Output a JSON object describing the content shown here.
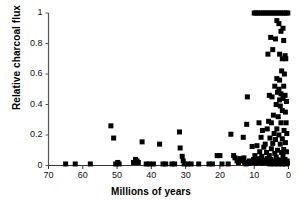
{
  "chart_data": {
    "type": "scatter",
    "title": "",
    "xlabel": "Millions of years",
    "ylabel": "Relative charcoal flux",
    "xlim": [
      70,
      0
    ],
    "ylim": [
      0,
      1
    ],
    "x_reversed": true,
    "grid": false,
    "legend": null,
    "marker": "filled-square",
    "marker_color": "#000000",
    "marker_size_px": 5,
    "xticks": [
      70,
      60,
      50,
      40,
      30,
      20,
      10,
      0
    ],
    "xtick_labels": [
      "70",
      "60",
      "50",
      "40",
      "30",
      "20",
      "10",
      "0"
    ],
    "yticks": [
      0,
      0.2,
      0.4,
      0.6,
      0.8,
      1
    ],
    "ytick_labels": [
      "0",
      "0.2",
      "0.4",
      "0.6",
      "0.8",
      "1"
    ],
    "series": [
      {
        "name": "Charcoal flux record",
        "points": [
          [
            65.0,
            0.01
          ],
          [
            62.2,
            0.01
          ],
          [
            57.8,
            0.01
          ],
          [
            51.8,
            0.26
          ],
          [
            51.0,
            0.18
          ],
          [
            50.4,
            0.01
          ],
          [
            49.8,
            0.02
          ],
          [
            49.4,
            0.01
          ],
          [
            45.2,
            0.02
          ],
          [
            44.6,
            0.04
          ],
          [
            44.2,
            0.03
          ],
          [
            43.8,
            0.02
          ],
          [
            42.7,
            0.155
          ],
          [
            41.5,
            0.01
          ],
          [
            40.6,
            0.01
          ],
          [
            39.4,
            0.01
          ],
          [
            37.6,
            0.14
          ],
          [
            36.6,
            0.01
          ],
          [
            35.8,
            0.01
          ],
          [
            34.0,
            0.01
          ],
          [
            33.2,
            0.01
          ],
          [
            31.8,
            0.22
          ],
          [
            31.6,
            0.115
          ],
          [
            31.0,
            0.06
          ],
          [
            30.7,
            0.03
          ],
          [
            30.4,
            0.01
          ],
          [
            29.4,
            0.01
          ],
          [
            28.4,
            0.01
          ],
          [
            26.2,
            0.01
          ],
          [
            23.2,
            0.01
          ],
          [
            22.2,
            0.01
          ],
          [
            20.8,
            0.065
          ],
          [
            20.0,
            0.065
          ],
          [
            19.4,
            0.01
          ],
          [
            17.6,
            0.01
          ],
          [
            16.8,
            0.205
          ],
          [
            16.0,
            0.065
          ],
          [
            15.6,
            0.05
          ],
          [
            15.0,
            0.03
          ],
          [
            14.6,
            0.02
          ],
          [
            14.2,
            0.045
          ],
          [
            13.4,
            0.03
          ],
          [
            13.0,
            0.05
          ],
          [
            12.8,
            0.02
          ],
          [
            13.2,
            0.185
          ],
          [
            12.0,
            0.45
          ],
          [
            12.2,
            0.27
          ],
          [
            11.4,
            0.03
          ],
          [
            11.0,
            0.02
          ],
          [
            10.6,
            0.125
          ],
          [
            10.4,
            0.02
          ],
          [
            10.0,
            1.0
          ],
          [
            9.6,
            1.0
          ],
          [
            9.0,
            1.0
          ],
          [
            8.4,
            1.0
          ],
          [
            7.8,
            1.0
          ],
          [
            7.2,
            1.0
          ],
          [
            6.6,
            1.0
          ],
          [
            6.0,
            1.0
          ],
          [
            5.4,
            1.0
          ],
          [
            4.8,
            1.0
          ],
          [
            4.2,
            1.0
          ],
          [
            3.6,
            1.0
          ],
          [
            3.0,
            1.0
          ],
          [
            2.4,
            1.0
          ],
          [
            1.8,
            1.0
          ],
          [
            1.2,
            1.0
          ],
          [
            0.6,
            1.0
          ],
          [
            0.2,
            1.0
          ],
          [
            3.4,
            0.95
          ],
          [
            2.8,
            0.93
          ],
          [
            2.2,
            0.88
          ],
          [
            1.6,
            0.9
          ],
          [
            5.2,
            0.84
          ],
          [
            3.8,
            0.83
          ],
          [
            1.4,
            0.82
          ],
          [
            6.0,
            0.73
          ],
          [
            4.6,
            0.76
          ],
          [
            2.6,
            0.73
          ],
          [
            1.0,
            0.72
          ],
          [
            1.8,
            0.7
          ],
          [
            0.8,
            0.7
          ],
          [
            2.0,
            0.62
          ],
          [
            1.2,
            0.6
          ],
          [
            3.4,
            0.57
          ],
          [
            2.6,
            0.56
          ],
          [
            4.0,
            0.52
          ],
          [
            2.8,
            0.5
          ],
          [
            1.4,
            0.52
          ],
          [
            3.2,
            0.48
          ],
          [
            2.2,
            0.47
          ],
          [
            1.0,
            0.46
          ],
          [
            5.6,
            0.46
          ],
          [
            4.8,
            0.45
          ],
          [
            2.6,
            0.43
          ],
          [
            1.6,
            0.44
          ],
          [
            0.6,
            0.42
          ],
          [
            3.6,
            0.4
          ],
          [
            2.4,
            0.39
          ],
          [
            1.8,
            0.36
          ],
          [
            0.9,
            0.35
          ],
          [
            4.4,
            0.33
          ],
          [
            3.0,
            0.32
          ],
          [
            5.8,
            0.29
          ],
          [
            5.0,
            0.28
          ],
          [
            2.2,
            0.28
          ],
          [
            0.7,
            0.28
          ],
          [
            8.6,
            0.28
          ],
          [
            7.6,
            0.23
          ],
          [
            6.2,
            0.24
          ],
          [
            3.4,
            0.24
          ],
          [
            1.3,
            0.23
          ],
          [
            4.2,
            0.21
          ],
          [
            2.8,
            0.2
          ],
          [
            0.5,
            0.21
          ],
          [
            8.0,
            0.185
          ],
          [
            5.4,
            0.18
          ],
          [
            3.8,
            0.17
          ],
          [
            1.8,
            0.175
          ],
          [
            6.8,
            0.14
          ],
          [
            4.6,
            0.145
          ],
          [
            2.4,
            0.14
          ],
          [
            0.9,
            0.15
          ],
          [
            9.2,
            0.13
          ],
          [
            7.2,
            0.12
          ],
          [
            5.0,
            0.11
          ],
          [
            3.2,
            0.1
          ],
          [
            1.4,
            0.105
          ],
          [
            8.4,
            0.09
          ],
          [
            6.4,
            0.085
          ],
          [
            4.0,
            0.08
          ],
          [
            2.0,
            0.085
          ],
          [
            0.6,
            0.09
          ],
          [
            9.8,
            0.065
          ],
          [
            7.8,
            0.06
          ],
          [
            5.6,
            0.065
          ],
          [
            3.6,
            0.055
          ],
          [
            1.6,
            0.06
          ],
          [
            10.2,
            0.04
          ],
          [
            9.0,
            0.045
          ],
          [
            8.2,
            0.04
          ],
          [
            7.0,
            0.035
          ],
          [
            6.2,
            0.045
          ],
          [
            5.2,
            0.04
          ],
          [
            4.4,
            0.03
          ],
          [
            3.4,
            0.04
          ],
          [
            2.6,
            0.035
          ],
          [
            1.8,
            0.03
          ],
          [
            1.0,
            0.04
          ],
          [
            0.4,
            0.03
          ],
          [
            9.4,
            0.015
          ],
          [
            8.6,
            0.02
          ],
          [
            7.6,
            0.015
          ],
          [
            6.8,
            0.02
          ],
          [
            6.0,
            0.015
          ],
          [
            5.4,
            0.01
          ],
          [
            4.8,
            0.02
          ],
          [
            4.2,
            0.01
          ],
          [
            3.6,
            0.015
          ],
          [
            3.0,
            0.01
          ],
          [
            2.4,
            0.015
          ],
          [
            1.8,
            0.01
          ],
          [
            1.2,
            0.015
          ],
          [
            0.8,
            0.01
          ],
          [
            0.3,
            0.015
          ],
          [
            11.6,
            0.015
          ],
          [
            12.4,
            0.01
          ],
          [
            10.8,
            0.02
          ]
        ]
      }
    ]
  }
}
